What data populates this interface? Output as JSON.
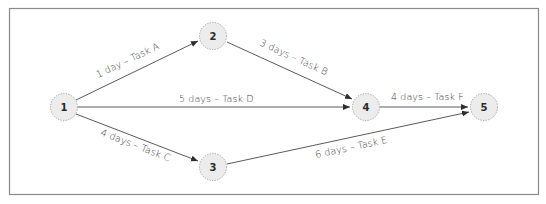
{
  "diagram": {
    "type": "activity-on-arrow network",
    "nodes": [
      {
        "id": "1",
        "label": "1"
      },
      {
        "id": "2",
        "label": "2"
      },
      {
        "id": "3",
        "label": "3"
      },
      {
        "id": "4",
        "label": "4"
      },
      {
        "id": "5",
        "label": "5"
      }
    ],
    "edges": [
      {
        "from": "1",
        "to": "2",
        "label": "1 day – Task A",
        "task": "Task A",
        "duration": "1 day"
      },
      {
        "from": "2",
        "to": "4",
        "label": "3 days – Task B",
        "task": "Task B",
        "duration": "3 days"
      },
      {
        "from": "1",
        "to": "4",
        "label": "5 days – Task D",
        "task": "Task D",
        "duration": "5 days"
      },
      {
        "from": "1",
        "to": "3",
        "label": "4 days – Task C",
        "task": "Task C",
        "duration": "4 days"
      },
      {
        "from": "4",
        "to": "5",
        "label": "4 days – Task F",
        "task": "Task F",
        "duration": "4 days"
      },
      {
        "from": "3",
        "to": "5",
        "label": "6 days – Task E",
        "task": "Task E",
        "duration": "6 days"
      }
    ],
    "colors": {
      "node_fill": "#ececec",
      "node_border": "#9a9a9a",
      "edge": "#5a5a5a",
      "frame": "#8a8a8a"
    }
  }
}
